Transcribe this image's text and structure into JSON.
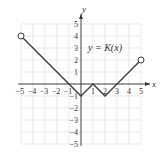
{
  "chart_data": {
    "type": "line",
    "title": "",
    "xlabel": "x",
    "ylabel": "y",
    "annotation": "y = K(x)",
    "xlim": [
      -5,
      5
    ],
    "ylim": [
      -5,
      5
    ],
    "grid": true,
    "x_ticks": [
      "-5",
      "-4",
      "-3",
      "-2",
      "-1",
      "1",
      "2",
      "3",
      "4",
      "5"
    ],
    "y_ticks": [
      "5",
      "4",
      "3",
      "2",
      "1",
      "-1",
      "-2",
      "-3",
      "-4",
      "-5"
    ],
    "series": [
      {
        "name": "K(x)",
        "points": [
          [
            -5,
            4
          ],
          [
            0,
            -1
          ],
          [
            1,
            0
          ],
          [
            2,
            -1
          ],
          [
            5,
            2
          ]
        ],
        "open_endpoints": [
          [
            -5,
            4
          ],
          [
            5,
            2
          ]
        ]
      }
    ]
  },
  "labels": {
    "x_axis": "x",
    "y_axis": "y",
    "function": "y = K(x)"
  },
  "colors": {
    "grid": "#d9d9d9",
    "axis": "#333333",
    "line": "#3a3a3a",
    "text": "#333333"
  }
}
